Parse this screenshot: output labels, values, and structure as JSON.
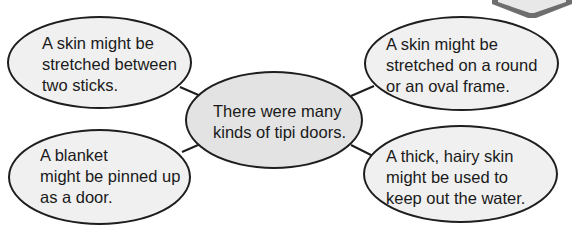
{
  "diagram": {
    "type": "web",
    "center": {
      "lines": [
        "There were many",
        "kinds of tipi doors."
      ]
    },
    "nodes": [
      {
        "id": "top-left",
        "lines": [
          "A skin might be",
          "stretched between",
          "two sticks."
        ]
      },
      {
        "id": "top-right",
        "lines": [
          "A skin might be",
          "stretched on a round",
          "or an oval frame."
        ]
      },
      {
        "id": "bottom-left",
        "lines": [
          "A blanket",
          "might be pinned up",
          "as a door."
        ]
      },
      {
        "id": "bottom-right",
        "lines": [
          "A thick, hairy skin",
          "might be used to",
          "keep out the water."
        ]
      }
    ],
    "colors": {
      "outer_fill": "#f0f0f0",
      "center_fill": "#e3e3e3",
      "stroke": "#1e1e1e",
      "corner_tab": "#6e6e6e"
    }
  }
}
